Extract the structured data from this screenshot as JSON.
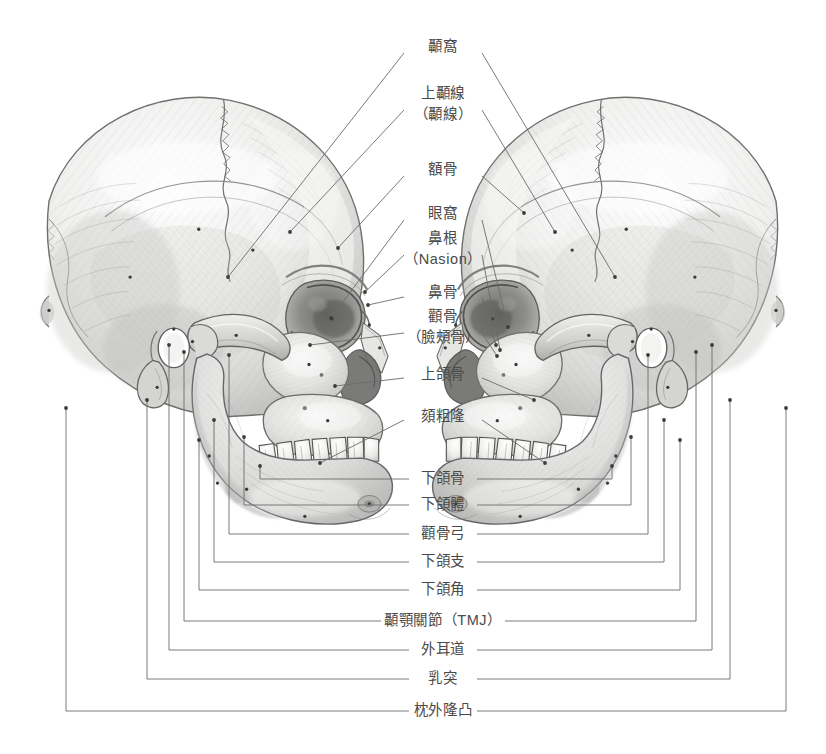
{
  "document": {
    "title": "頭顱骨解剖標示圖",
    "language": "zh-Hant",
    "background_color": "#ffffff",
    "ink_color": "#4a4a4a",
    "line_color": "#6b6b6b"
  },
  "figure": {
    "type": "anatomical-illustration",
    "view": "three-quarter-oblique",
    "rendering": "graphite-pencil-shading",
    "specimen_count": 2,
    "specimens": [
      {
        "name": "left-skull",
        "facing": "right",
        "center_x": 205,
        "center_y": 300
      },
      {
        "name": "right-skull",
        "facing": "left",
        "center_x": 620,
        "center_y": 300
      }
    ]
  },
  "labels": [
    {
      "id": "temporal-fossa",
      "text": "顳窩",
      "text2": "",
      "x": 443,
      "y": 47,
      "style": "radial"
    },
    {
      "id": "superior-temporal-line",
      "text": "上顳線",
      "text2": "（顳線）",
      "x": 443,
      "y": 104,
      "style": "radial"
    },
    {
      "id": "frontal-bone",
      "text": "額骨",
      "text2": "",
      "x": 443,
      "y": 170,
      "style": "radial"
    },
    {
      "id": "orbit",
      "text": "眼窩",
      "text2": "",
      "x": 443,
      "y": 214,
      "style": "radial"
    },
    {
      "id": "nasion",
      "text": "鼻根",
      "text2": "（Nasion）",
      "x": 443,
      "y": 249,
      "style": "radial"
    },
    {
      "id": "nasal-bone",
      "text": "鼻骨",
      "text2": "",
      "x": 443,
      "y": 293,
      "style": "radial"
    },
    {
      "id": "zygomatic-bone",
      "text": "顴骨",
      "text2": "（臉頰骨）",
      "x": 443,
      "y": 327,
      "style": "radial"
    },
    {
      "id": "maxilla",
      "text": "上頜骨",
      "text2": "",
      "x": 443,
      "y": 375,
      "style": "radial"
    },
    {
      "id": "mental-protuberance",
      "text": "頦粗隆",
      "text2": "",
      "x": 443,
      "y": 417,
      "style": "radial"
    },
    {
      "id": "mandible",
      "text": "下頜骨",
      "text2": "",
      "x": 443,
      "y": 479,
      "style": "bracket",
      "bracket": 1
    },
    {
      "id": "body-of-mandible",
      "text": "下頜體",
      "text2": "",
      "x": 443,
      "y": 505,
      "style": "bracket",
      "bracket": 2
    },
    {
      "id": "zygomatic-arch",
      "text": "顴骨弓",
      "text2": "",
      "x": 443,
      "y": 534,
      "style": "bracket",
      "bracket": 3
    },
    {
      "id": "ramus-of-mandible",
      "text": "下頜支",
      "text2": "",
      "x": 443,
      "y": 562,
      "style": "bracket",
      "bracket": 4
    },
    {
      "id": "angle-of-mandible",
      "text": "下頜角",
      "text2": "",
      "x": 443,
      "y": 590,
      "style": "bracket",
      "bracket": 5
    },
    {
      "id": "tmj",
      "text": "顳顎關節（TMJ）",
      "text2": "",
      "x": 443,
      "y": 621,
      "style": "bracket",
      "bracket": 6
    },
    {
      "id": "external-acoustic-meatus",
      "text": "外耳道",
      "text2": "",
      "x": 443,
      "y": 650,
      "style": "bracket",
      "bracket": 7
    },
    {
      "id": "mastoid-process",
      "text": "乳突",
      "text2": "",
      "x": 443,
      "y": 679,
      "style": "bracket",
      "bracket": 8
    },
    {
      "id": "external-occipital-protuberance",
      "text": "枕外隆凸",
      "text2": "",
      "x": 443,
      "y": 711,
      "style": "bracket",
      "bracket": 9
    }
  ],
  "leaders": {
    "radial": [
      {
        "label": "temporal-fossa",
        "side": "left",
        "x1": 404,
        "y1": 53,
        "x2": 228,
        "y2": 277
      },
      {
        "label": "temporal-fossa",
        "side": "right",
        "x1": 482,
        "y1": 53,
        "x2": 615,
        "y2": 277
      },
      {
        "label": "superior-temporal-line",
        "side": "left",
        "x1": 404,
        "y1": 110,
        "x2": 290,
        "y2": 232
      },
      {
        "label": "superior-temporal-line",
        "side": "right",
        "x1": 482,
        "y1": 110,
        "x2": 555,
        "y2": 232
      },
      {
        "label": "frontal-bone",
        "side": "left",
        "x1": 404,
        "y1": 176,
        "x2": 338,
        "y2": 248
      },
      {
        "label": "frontal-bone",
        "side": "right",
        "x1": 482,
        "y1": 176,
        "x2": 524,
        "y2": 213
      },
      {
        "label": "orbit",
        "side": "left",
        "x1": 404,
        "y1": 220,
        "x2": 331,
        "y2": 318
      },
      {
        "label": "orbit",
        "side": "right",
        "x1": 482,
        "y1": 220,
        "x2": 508,
        "y2": 327
      },
      {
        "label": "nasion",
        "side": "left",
        "x1": 404,
        "y1": 255,
        "x2": 365,
        "y2": 292
      },
      {
        "label": "nasion",
        "side": "right",
        "x1": 482,
        "y1": 255,
        "x2": 500,
        "y2": 350
      },
      {
        "label": "nasal-bone",
        "side": "left",
        "x1": 404,
        "y1": 297,
        "x2": 368,
        "y2": 305
      },
      {
        "label": "nasal-bone",
        "side": "right",
        "x1": 482,
        "y1": 297,
        "x2": 496,
        "y2": 345
      },
      {
        "label": "zygomatic-bone",
        "side": "left",
        "x1": 404,
        "y1": 333,
        "x2": 310,
        "y2": 345
      },
      {
        "label": "zygomatic-bone",
        "side": "right",
        "x1": 482,
        "y1": 333,
        "x2": 497,
        "y2": 356
      },
      {
        "label": "maxilla",
        "side": "left",
        "x1": 404,
        "y1": 378,
        "x2": 335,
        "y2": 386
      },
      {
        "label": "maxilla",
        "side": "right",
        "x1": 482,
        "y1": 378,
        "x2": 534,
        "y2": 400
      },
      {
        "label": "mental-protuberance",
        "side": "left",
        "x1": 404,
        "y1": 420,
        "x2": 320,
        "y2": 463
      },
      {
        "label": "mental-protuberance",
        "side": "right",
        "x1": 482,
        "y1": 420,
        "x2": 545,
        "y2": 463
      }
    ],
    "brackets": [
      {
        "n": 1,
        "y": 479,
        "left_x": 260,
        "right_x": 612,
        "top_left_y": 466,
        "top_right_y": 466
      },
      {
        "n": 2,
        "y": 505,
        "left_x": 244,
        "right_x": 631,
        "top_left_y": 437,
        "top_right_y": 437
      },
      {
        "n": 3,
        "y": 534,
        "left_x": 229,
        "right_x": 648,
        "top_left_y": 355,
        "top_right_y": 355
      },
      {
        "n": 4,
        "y": 562,
        "left_x": 214,
        "right_x": 664,
        "top_left_y": 420,
        "top_right_y": 420
      },
      {
        "n": 5,
        "y": 590,
        "left_x": 199,
        "right_x": 680,
        "top_left_y": 440,
        "top_right_y": 440
      },
      {
        "n": 6,
        "y": 621,
        "left_x": 184,
        "right_x": 696,
        "top_left_y": 352,
        "top_right_y": 352
      },
      {
        "n": 7,
        "y": 650,
        "left_x": 169,
        "right_x": 712,
        "top_left_y": 345,
        "top_right_y": 345
      },
      {
        "n": 8,
        "y": 679,
        "left_x": 147,
        "right_x": 730,
        "top_left_y": 400,
        "top_right_y": 400
      },
      {
        "n": 9,
        "y": 711,
        "left_x": 66,
        "right_x": 786,
        "top_left_y": 408,
        "top_right_y": 408
      }
    ]
  },
  "anchor_dots": [
    {
      "x": 228,
      "y": 277
    },
    {
      "x": 615,
      "y": 277
    },
    {
      "x": 290,
      "y": 232
    },
    {
      "x": 555,
      "y": 232
    },
    {
      "x": 338,
      "y": 248
    },
    {
      "x": 524,
      "y": 213
    },
    {
      "x": 331,
      "y": 318
    },
    {
      "x": 508,
      "y": 327
    },
    {
      "x": 365,
      "y": 292
    },
    {
      "x": 500,
      "y": 350
    },
    {
      "x": 368,
      "y": 305
    },
    {
      "x": 496,
      "y": 345
    },
    {
      "x": 310,
      "y": 345
    },
    {
      "x": 497,
      "y": 356
    },
    {
      "x": 335,
      "y": 386
    },
    {
      "x": 534,
      "y": 400
    },
    {
      "x": 320,
      "y": 463
    },
    {
      "x": 545,
      "y": 463
    },
    {
      "x": 260,
      "y": 466
    },
    {
      "x": 612,
      "y": 466
    },
    {
      "x": 244,
      "y": 437
    },
    {
      "x": 631,
      "y": 437
    },
    {
      "x": 229,
      "y": 355
    },
    {
      "x": 648,
      "y": 355
    },
    {
      "x": 214,
      "y": 420
    },
    {
      "x": 664,
      "y": 420
    },
    {
      "x": 199,
      "y": 440
    },
    {
      "x": 680,
      "y": 440
    },
    {
      "x": 184,
      "y": 352
    },
    {
      "x": 696,
      "y": 352
    },
    {
      "x": 169,
      "y": 345
    },
    {
      "x": 712,
      "y": 345
    },
    {
      "x": 147,
      "y": 400
    },
    {
      "x": 730,
      "y": 400
    },
    {
      "x": 66,
      "y": 408
    },
    {
      "x": 786,
      "y": 408
    }
  ]
}
